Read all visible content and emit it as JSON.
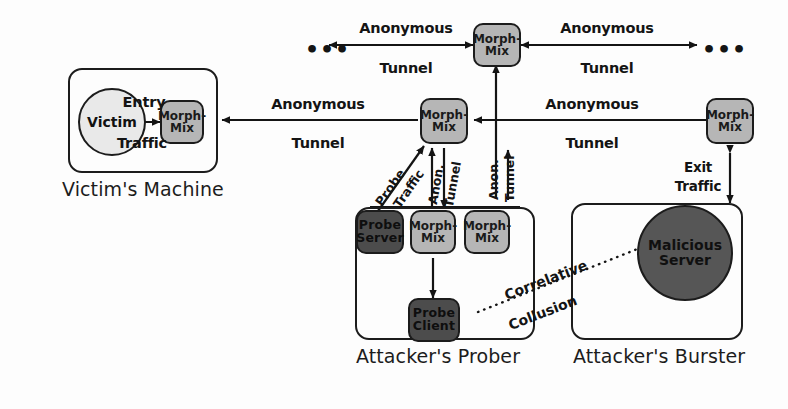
{
  "diagram": {
    "colors": {
      "mix_node_fill": "#b6b6b6",
      "attacker_node_fill": "#4c4c4c",
      "victim_fill": "#e9e9e9",
      "malicious_server_fill": "#565656",
      "stroke": "#1c1c1c",
      "background": "#fdfdfd"
    }
  },
  "containers": [
    {
      "id": "victims-machine",
      "caption": "Victim's Machine"
    },
    {
      "id": "attackers-prober",
      "caption": "Attacker's Prober"
    },
    {
      "id": "attackers-burster",
      "caption": "Attacker's Burster"
    }
  ],
  "nodes": {
    "victim": {
      "line1": "Victim",
      "line2": ""
    },
    "mix_victim": {
      "line1": "Morph-",
      "line2": "Mix"
    },
    "mix_top": {
      "line1": "Morph-",
      "line2": "Mix"
    },
    "mix_middle": {
      "line1": "Morph-",
      "line2": "Mix"
    },
    "mix_right": {
      "line1": "Morph-",
      "line2": "Mix"
    },
    "mix_prober_left": {
      "line1": "Morph-",
      "line2": "Mix"
    },
    "mix_prober_right": {
      "line1": "Morph-",
      "line2": "Mix"
    },
    "probe_server": {
      "line1": "Probe",
      "line2": "Server"
    },
    "probe_client": {
      "line1": "Probe",
      "line2": "Client"
    },
    "malicious_server": {
      "line1": "Malicious",
      "line2": "Server"
    }
  },
  "edge_labels": {
    "entry_traffic_top": "Entry",
    "entry_traffic_bottom": "Traffic",
    "anon_tunnel_left_top": "Anonymous",
    "anon_tunnel_left_bottom": "Tunnel",
    "anon_tunnel_topleft_top": "Anonymous",
    "anon_tunnel_topleft_bottom": "Tunnel",
    "anon_tunnel_topright_top": "Anonymous",
    "anon_tunnel_topright_bottom": "Tunnel",
    "anon_tunnel_right_top": "Anonymous",
    "anon_tunnel_right_bottom": "Tunnel",
    "exit_traffic_top": "Exit",
    "exit_traffic_bottom": "Traffic",
    "probe_traffic_a": "Probe",
    "probe_traffic_b": "Traffic",
    "anon_tunnel_diag_a": "Anon.",
    "anon_tunnel_diag_b": "Tunnel",
    "anon_tunnel_vert_a": "Anon.",
    "anon_tunnel_vert_b": "Tunnel",
    "correlative": "Correlative",
    "collusion": "Collusion",
    "ellipsis_left": "•••",
    "ellipsis_right": "•••"
  }
}
